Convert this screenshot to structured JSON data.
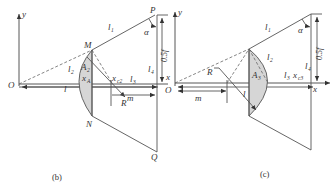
{
  "figures": [
    {
      "id": "b",
      "caption": "(b)",
      "axes": {
        "y_label": "y",
        "x_label": "x",
        "origin_label": "O"
      },
      "points": {
        "M": "M",
        "N": "N",
        "P": "P",
        "Q": "Q",
        "R": "R"
      },
      "labels": {
        "l1": "l",
        "l1_sub": "1",
        "l2": "l",
        "l2_sub": "2",
        "l3": "l",
        "l3_sub": "3",
        "l4": "l",
        "l4_sub": "4",
        "l": "l",
        "A2": "A",
        "A2_sub": "2",
        "xA": "x",
        "xA_sub": "A",
        "xc2": "x",
        "xc2_sub": "c2",
        "m": "m",
        "alpha": "α",
        "half_f": "0.5f"
      }
    },
    {
      "id": "c",
      "caption": "(c)",
      "axes": {
        "y_label": "y",
        "x_label": "x",
        "origin_label": "O"
      },
      "labels": {
        "l1": "l",
        "l1_sub": "1",
        "l2": "l",
        "l2_sub": "2",
        "l3": "l",
        "l3_sub": "3",
        "l4": "l",
        "l4_sub": "4",
        "l": "l",
        "A3": "A",
        "A3_sub": "3",
        "xc3": "x",
        "xc3_sub": "c3",
        "m": "m",
        "R": "R",
        "alpha": "α",
        "half_f": "0.5f",
        "x_left": "x"
      }
    }
  ]
}
